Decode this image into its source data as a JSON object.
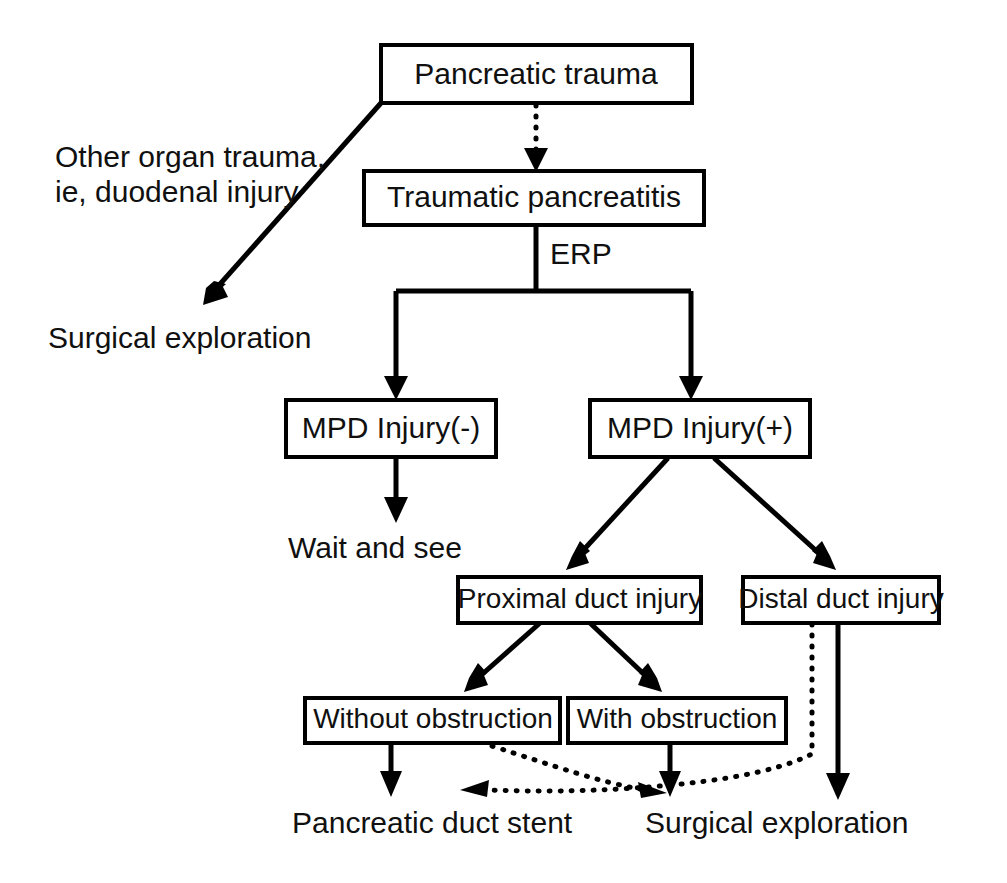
{
  "diagram": {
    "type": "flowchart",
    "canvas": {
      "width": 1007,
      "height": 883
    },
    "colors": {
      "line": "#000000",
      "box_fill": "#ffffff",
      "text": "#101010"
    }
  },
  "nodes": {
    "pancreatic_trauma": "Pancreatic trauma",
    "traumatic_pancreatitis": "Traumatic pancreatitis",
    "mpd_injury_negative": "MPD Injury(-)",
    "mpd_injury_positive": "MPD Injury(+)",
    "proximal_duct_injury": "Proximal duct injury",
    "distal_duct_injury": "Distal duct injury",
    "without_obstruction": "Without obstruction",
    "with_obstruction": "With obstruction"
  },
  "labels": {
    "other_organ_trauma_line1": "Other organ trauma,",
    "other_organ_trauma_line2": "ie, duodenal injury",
    "surgical_exploration_top": "Surgical exploration",
    "erp": "ERP",
    "wait_and_see": "Wait and see",
    "pancreatic_duct_stent": "Pancreatic duct stent",
    "surgical_exploration_bottom": "Surgical exploration"
  },
  "edges": [
    {
      "id": "trauma-to-surgical",
      "from": "pancreatic_trauma",
      "to": "surgical_exploration_top",
      "style": "solid",
      "label": "Other organ trauma, ie, duodenal injury"
    },
    {
      "id": "trauma-to-pancreatitis",
      "from": "pancreatic_trauma",
      "to": "traumatic_pancreatitis",
      "style": "dotted"
    },
    {
      "id": "pancreatitis-to-mpd-neg",
      "from": "traumatic_pancreatitis",
      "to": "mpd_injury_negative",
      "style": "solid",
      "label": "ERP"
    },
    {
      "id": "pancreatitis-to-mpd-pos",
      "from": "traumatic_pancreatitis",
      "to": "mpd_injury_positive",
      "style": "solid",
      "label": "ERP"
    },
    {
      "id": "mpd-neg-to-wait",
      "from": "mpd_injury_negative",
      "to": "wait_and_see",
      "style": "solid"
    },
    {
      "id": "mpd-pos-to-proximal",
      "from": "mpd_injury_positive",
      "to": "proximal_duct_injury",
      "style": "solid"
    },
    {
      "id": "mpd-pos-to-distal",
      "from": "mpd_injury_positive",
      "to": "distal_duct_injury",
      "style": "solid"
    },
    {
      "id": "proximal-to-without",
      "from": "proximal_duct_injury",
      "to": "without_obstruction",
      "style": "solid"
    },
    {
      "id": "proximal-to-with",
      "from": "proximal_duct_injury",
      "to": "with_obstruction",
      "style": "solid"
    },
    {
      "id": "without-to-stent",
      "from": "without_obstruction",
      "to": "pancreatic_duct_stent",
      "style": "solid"
    },
    {
      "id": "without-to-surgical",
      "from": "without_obstruction",
      "to": "surgical_exploration_bottom",
      "style": "dotted"
    },
    {
      "id": "with-to-surgical",
      "from": "with_obstruction",
      "to": "surgical_exploration_bottom",
      "style": "solid"
    },
    {
      "id": "distal-to-stent",
      "from": "distal_duct_injury",
      "to": "pancreatic_duct_stent",
      "style": "dotted"
    },
    {
      "id": "distal-to-surgical",
      "from": "distal_duct_injury",
      "to": "surgical_exploration_bottom",
      "style": "solid"
    }
  ]
}
